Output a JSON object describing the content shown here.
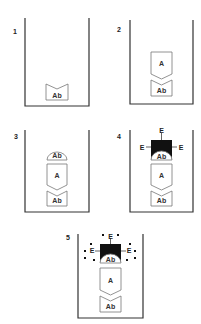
{
  "diagram": {
    "type": "sandwich-elisa-steps",
    "panels": [
      {
        "number": "1",
        "layers": [
          "Ab"
        ]
      },
      {
        "number": "2",
        "layers": [
          "Ab",
          "A"
        ]
      },
      {
        "number": "3",
        "layers": [
          "Ab",
          "A",
          "Ab"
        ]
      },
      {
        "number": "4",
        "layers": [
          "Ab",
          "A",
          "Ab",
          "E"
        ],
        "enzyme_labels": [
          "E",
          "E",
          "E"
        ]
      },
      {
        "number": "5",
        "layers": [
          "Ab",
          "A",
          "Ab",
          "E"
        ],
        "enzyme_labels": [
          "E",
          "E",
          "E"
        ],
        "product_dots": true
      }
    ]
  },
  "labels": {
    "p1": "1",
    "p2": "2",
    "p3": "3",
    "p4": "4",
    "p5": "5",
    "ab": "Ab",
    "a": "A",
    "e": "E"
  },
  "colors": {
    "stroke": "#333333",
    "box_stroke": "#777777",
    "enzyme_fill": "#111111",
    "background": "#ffffff"
  }
}
